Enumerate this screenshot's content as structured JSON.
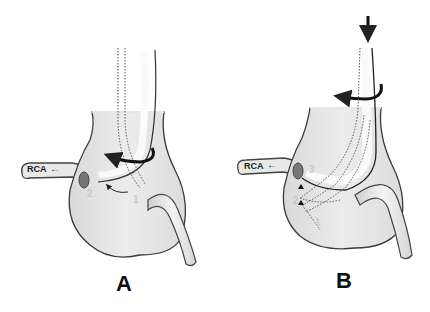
{
  "figure": {
    "panels": [
      {
        "id": "A",
        "label": "A",
        "vessel_label": "RCA",
        "step_labels": [
          "1",
          "2"
        ],
        "annotations": [
          "rotation-arrow",
          "curved-arrow-2-from-1"
        ]
      },
      {
        "id": "B",
        "label": "B",
        "vessel_label": "RCA",
        "step_labels": [
          "1",
          "2",
          "3"
        ],
        "annotations": [
          "push-down-arrow",
          "rotation-arrow",
          "upward-arrowheads"
        ]
      }
    ],
    "colors": {
      "root_fill": "#e6e6e6",
      "outline": "#333333",
      "catheter_fill": "#f2f2f2",
      "label_faint": "#c8c8c8"
    }
  }
}
